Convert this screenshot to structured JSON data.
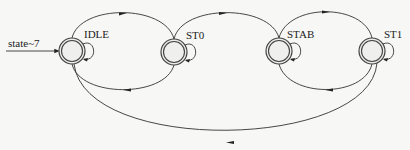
{
  "diagram": {
    "type": "state-machine",
    "reset_label": "state~7",
    "states": [
      {
        "id": "IDLE",
        "label": "IDLE",
        "x": 72,
        "y": 51
      },
      {
        "id": "ST0",
        "label": "ST0",
        "x": 174,
        "y": 52
      },
      {
        "id": "STAB",
        "label": "STAB",
        "x": 279,
        "y": 51
      },
      {
        "id": "ST1",
        "label": "ST1",
        "x": 372,
        "y": 51
      }
    ],
    "transitions": [
      {
        "from": "IDLE",
        "to": "IDLE"
      },
      {
        "from": "IDLE",
        "to": "ST0"
      },
      {
        "from": "ST0",
        "to": "IDLE"
      },
      {
        "from": "ST0",
        "to": "ST0"
      },
      {
        "from": "ST0",
        "to": "STAB"
      },
      {
        "from": "STAB",
        "to": "STAB"
      },
      {
        "from": "STAB",
        "to": "ST1"
      },
      {
        "from": "ST1",
        "to": "STAB"
      },
      {
        "from": "ST1",
        "to": "ST1"
      },
      {
        "from": "ST1",
        "to": "IDLE"
      }
    ],
    "colors": {
      "line": "#333333",
      "node_fill": "#ececea",
      "background": "#f7f7f5"
    }
  }
}
